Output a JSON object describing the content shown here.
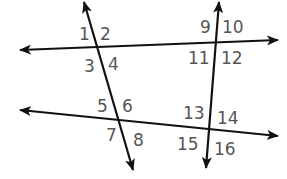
{
  "diagram": {
    "line_color": "#111111",
    "label_color": "#555555",
    "lines": [
      {
        "id": "top-horizontal",
        "x1": 278,
        "y1": 40,
        "x2": 20,
        "y2": 50,
        "arrows": "both"
      },
      {
        "id": "bottom-horizontal",
        "x1": 20,
        "y1": 110,
        "x2": 278,
        "y2": 136,
        "arrows": "both"
      },
      {
        "id": "left-transversal",
        "x1": 84,
        "y1": 2,
        "x2": 133,
        "y2": 170,
        "arrows": "both"
      },
      {
        "id": "right-transversal",
        "x1": 219,
        "y1": 2,
        "x2": 206,
        "y2": 168,
        "arrows": "both"
      }
    ],
    "angle_labels": [
      {
        "text": "1",
        "x": 79,
        "y": 40
      },
      {
        "text": "2",
        "x": 100,
        "y": 40
      },
      {
        "text": "3",
        "x": 84,
        "y": 72
      },
      {
        "text": "4",
        "x": 108,
        "y": 70
      },
      {
        "text": "5",
        "x": 97,
        "y": 112
      },
      {
        "text": "6",
        "x": 122,
        "y": 112
      },
      {
        "text": "7",
        "x": 106,
        "y": 141
      },
      {
        "text": "8",
        "x": 133,
        "y": 146
      },
      {
        "text": "9",
        "x": 200,
        "y": 33
      },
      {
        "text": "10",
        "x": 222,
        "y": 33
      },
      {
        "text": "11",
        "x": 188,
        "y": 64
      },
      {
        "text": "12",
        "x": 221,
        "y": 64
      },
      {
        "text": "13",
        "x": 183,
        "y": 119
      },
      {
        "text": "14",
        "x": 217,
        "y": 124
      },
      {
        "text": "15",
        "x": 177,
        "y": 150
      },
      {
        "text": "16",
        "x": 214,
        "y": 155
      }
    ]
  }
}
